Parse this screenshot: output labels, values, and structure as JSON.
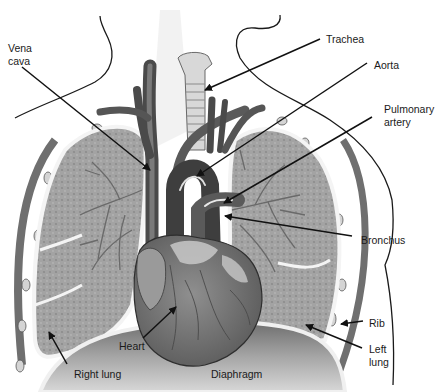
{
  "diagram": {
    "colors": {
      "background": "#ffffff",
      "outline": "#1a1a1a",
      "lung_fill": "#9c9c9c",
      "lung_texture": "#8a8a8a",
      "pleura": "#e6e6e6",
      "rib": "#6f6f6f",
      "rib_cartilage": "#d4d4d4",
      "vessel_dark": "#4a4a4a",
      "vessel_mid": "#6a6a6a",
      "highlight": "#f0f0f0",
      "heart_fill": "#7c7c7c",
      "heart_light": "#c8c8c8",
      "diaphragm": "#9a9a9a",
      "trachea": "#d8d8d8",
      "leader": "#111111"
    },
    "labels": [
      {
        "id": "vena-cava",
        "text": "Vena\ncava",
        "x": 8,
        "y": 42,
        "line": [
          [
            22,
            67
          ],
          [
            150,
            170
          ]
        ],
        "arrow": true
      },
      {
        "id": "trachea",
        "text": "Trachea",
        "x": 326,
        "y": 33,
        "line": [
          [
            320,
            39
          ],
          [
            205,
            90
          ]
        ],
        "arrow": true
      },
      {
        "id": "aorta",
        "text": "Aorta",
        "x": 374,
        "y": 59,
        "line": [
          [
            367,
            63
          ],
          [
            197,
            176
          ]
        ],
        "arrow": true
      },
      {
        "id": "pulmonary-artery",
        "text": "Pulmonary\nartery",
        "x": 384,
        "y": 103,
        "line": [
          [
            372,
            117
          ],
          [
            224,
            203
          ]
        ],
        "arrow": true
      },
      {
        "id": "bronchus",
        "text": "Bronchus",
        "x": 361,
        "y": 234,
        "line": [
          [
            352,
            236
          ],
          [
            225,
            216
          ]
        ],
        "arrow": true
      },
      {
        "id": "rib",
        "text": "Rib",
        "x": 369,
        "y": 317,
        "line": [
          [
            363,
            321
          ],
          [
            341,
            324
          ]
        ],
        "arrow": true
      },
      {
        "id": "left-lung",
        "text": "Left\nlung",
        "x": 369,
        "y": 343,
        "line": [
          [
            362,
            348
          ],
          [
            306,
            325
          ]
        ],
        "arrow": true
      },
      {
        "id": "heart",
        "text": "Heart",
        "x": 119,
        "y": 340,
        "line": [
          [
            143,
            338
          ],
          [
            176,
            307
          ]
        ],
        "arrow": true
      },
      {
        "id": "right-lung",
        "text": "Right lung",
        "x": 74,
        "y": 368,
        "line": [
          [
            67,
            364
          ],
          [
            49,
            332
          ]
        ],
        "arrow": true
      },
      {
        "id": "diaphragm",
        "text": "Diaphragm",
        "x": 211,
        "y": 368,
        "line": null,
        "arrow": false
      }
    ]
  }
}
